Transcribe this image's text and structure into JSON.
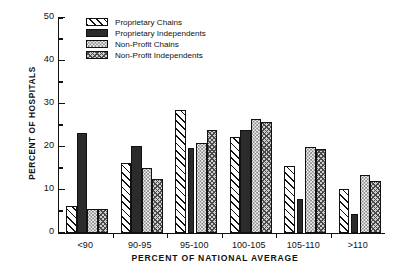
{
  "chart_data": {
    "type": "bar",
    "title": "",
    "xlabel": "PERCENT OF NATIONAL AVERAGE",
    "ylabel": "PERCENT OF HOSPITALS",
    "categories": [
      "<90",
      "90-95",
      "95-100",
      "100-105",
      "105-110",
      ">110"
    ],
    "ylim": [
      0,
      50
    ],
    "yticks_major": [
      0,
      10,
      20,
      30,
      40,
      50
    ],
    "yticks_minor": [
      5,
      15,
      25,
      35,
      45
    ],
    "ytick_labels": [
      "0",
      "10",
      "20",
      "30",
      "40",
      "50"
    ],
    "grid": false,
    "legend_position": "upper-left-inside",
    "series": [
      {
        "name": "Proprietary Chains",
        "pattern": "diagonal-hatch",
        "values": [
          6.2,
          16.3,
          28.5,
          22.3,
          15.5,
          10.3
        ]
      },
      {
        "name": "Proprietary Independents",
        "pattern": "solid-dark",
        "values": [
          23.3,
          20.3,
          19.7,
          24.0,
          8.0,
          4.5
        ]
      },
      {
        "name": "Non-Profit Chains",
        "pattern": "light-dots",
        "values": [
          5.5,
          15.2,
          21.0,
          26.5,
          20.0,
          13.5
        ]
      },
      {
        "name": "Non-Profit Independents",
        "pattern": "cross-hatch",
        "values": [
          5.5,
          12.5,
          24.0,
          25.8,
          19.5,
          12.0
        ]
      }
    ]
  }
}
